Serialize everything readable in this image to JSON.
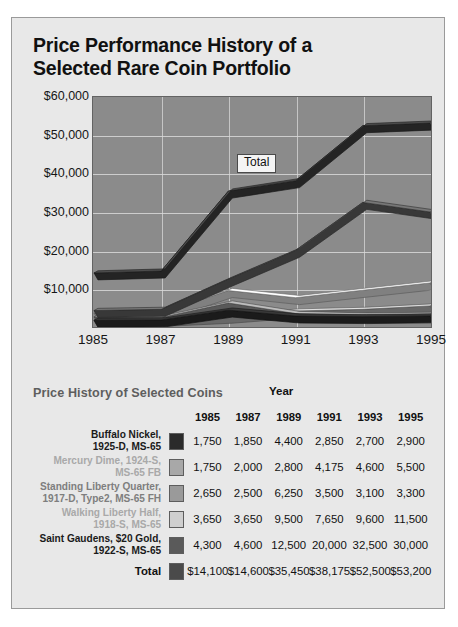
{
  "title": "Price Performance History of a Selected Rare Coin Portfolio",
  "chart_data": {
    "type": "line",
    "title": "Price Performance History of a Selected Rare Coin Portfolio",
    "xlabel": "",
    "ylabel": "",
    "x": [
      1985,
      1987,
      1989,
      1991,
      1993,
      1995
    ],
    "tick_labels": [
      "1985",
      "1987",
      "1989",
      "1991",
      "1993",
      "1995"
    ],
    "ylim": [
      0,
      60000
    ],
    "yticks": [
      0,
      10000,
      20000,
      30000,
      40000,
      50000,
      60000
    ],
    "ytick_labels": [
      "",
      "$10,000",
      "$20,000",
      "$30,000",
      "$40,000",
      "$50,000",
      "$60,000"
    ],
    "grid": true,
    "legend": "table",
    "annotations": [
      {
        "text": "Total",
        "x": 1990,
        "y": 43000
      }
    ],
    "series": [
      {
        "name": "Buffalo Nickel, 1925-D, MS-65",
        "color": "#2b2b2b",
        "values": [
          1750,
          1850,
          4400,
          2850,
          2700,
          2900
        ]
      },
      {
        "name": "Mercury Dime, 1924-S, MS-65 FB",
        "color": "#a8a8a8",
        "values": [
          1750,
          2000,
          2800,
          4175,
          4600,
          5500
        ]
      },
      {
        "name": "Standing Liberty Quarter, 1917-D, Type2, MS-65 FH",
        "color": "#8f8f8f",
        "values": [
          2650,
          2500,
          6250,
          3500,
          3100,
          3300
        ]
      },
      {
        "name": "Walking Liberty Half, 1918-S, MS-65",
        "color": "#cfcfcf",
        "values": [
          3650,
          3650,
          9500,
          7650,
          9600,
          11500
        ]
      },
      {
        "name": "Saint Gaudens, $20 Gold, 1922-S, MS-65",
        "color": "#5a5a5a",
        "values": [
          4300,
          4600,
          12500,
          20000,
          32500,
          30000
        ]
      },
      {
        "name": "Total",
        "color": "#3a3a3a",
        "values": [
          14100,
          14600,
          35450,
          38175,
          52500,
          53200
        ]
      }
    ]
  },
  "table": {
    "caption": "Price History of Selected Coins",
    "year_header": "Year",
    "columns": [
      "1985",
      "1987",
      "1989",
      "1991",
      "1993",
      "1995"
    ],
    "rows": [
      {
        "label": "Buffalo Nickel,\n1925-D, MS-65",
        "tone": "dark",
        "swatch": "#2b2b2b",
        "values": [
          "1,750",
          "1,850",
          "4,400",
          "2,850",
          "2,700",
          "2,900"
        ]
      },
      {
        "label": "Mercury Dime, 1924-S,\nMS-65 FB",
        "tone": "light",
        "swatch": "#a8a8a8",
        "values": [
          "1,750",
          "2,000",
          "2,800",
          "4,175",
          "4,600",
          "5,500"
        ]
      },
      {
        "label": "Standing Liberty Quarter,\n1917-D, Type2, MS-65 FH",
        "tone": "mid",
        "swatch": "#9a9a9a",
        "values": [
          "2,650",
          "2,500",
          "6,250",
          "3,500",
          "3,100",
          "3,300"
        ]
      },
      {
        "label": "Walking Liberty Half,\n1918-S, MS-65",
        "tone": "light",
        "swatch": "#cfcfcf",
        "values": [
          "3,650",
          "3,650",
          "9,500",
          "7,650",
          "9,600",
          "11,500"
        ]
      },
      {
        "label": "Saint Gaudens, $20 Gold,\n1922-S, MS-65",
        "tone": "dark",
        "swatch": "#5a5a5a",
        "values": [
          "4,300",
          "4,600",
          "12,500",
          "20,000",
          "32,500",
          "30,000"
        ]
      }
    ],
    "total": {
      "label": "Total",
      "swatch": "#4a4a4a",
      "values": [
        "$14,100",
        "$14,600",
        "$35,450",
        "$38,175",
        "$52,500",
        "$53,200"
      ]
    }
  },
  "colors": {
    "card_bg": "#e8e8e8",
    "plot_bg": "#8b8b8b",
    "gridline": "#d8d8d8",
    "text": "#111111"
  }
}
